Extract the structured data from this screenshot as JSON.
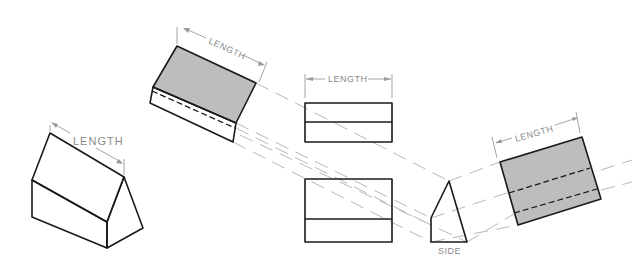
{
  "figure": {
    "labels": {
      "iso_length": "LENGTH",
      "aux_top_length": "LENGTH",
      "top_view_length": "LENGTH",
      "aux_right_length": "LENGTH",
      "side": "SIDE"
    },
    "colors": {
      "line": "#1a1a1a",
      "shade": "#bdbdbd",
      "projection": "#b8b8b8",
      "dimension": "#9a9a9a"
    }
  }
}
